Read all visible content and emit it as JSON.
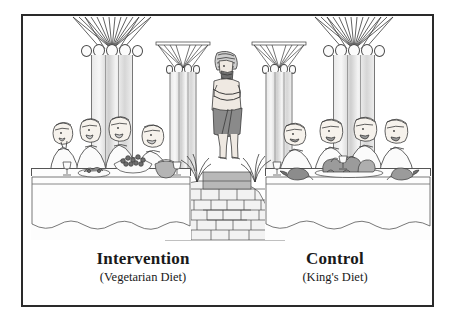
{
  "figure": {
    "frame": {
      "border_color": "#2a2a2a"
    },
    "captions": [
      {
        "title": "Intervention",
        "subtitle": "(Vegetarian Diet)"
      },
      {
        "title": "Control",
        "subtitle": "(King's Diet)"
      }
    ],
    "scene": {
      "center_figure": "standing-king-statue",
      "pedestal": "stone-pedestal",
      "plants": "reed-plants",
      "columns": [
        {
          "name": "papyrus-column-far-left",
          "size": "large"
        },
        {
          "name": "papyrus-column-inner-left",
          "size": "small"
        },
        {
          "name": "papyrus-column-inner-right",
          "size": "small"
        },
        {
          "name": "papyrus-column-far-right",
          "size": "large"
        }
      ],
      "tables": [
        {
          "name": "intervention-table",
          "diners": 4,
          "food": [
            "grape-cluster",
            "vegetable-bowl",
            "fruit-basket",
            "greens",
            "goblet"
          ]
        },
        {
          "name": "control-table",
          "diners": 4,
          "food": [
            "roast-fowl",
            "roast-meat-platter",
            "roast-bird",
            "goblet"
          ]
        }
      ]
    },
    "palette": {
      "ink": "#3a3a3a",
      "skin": "#efe9e2",
      "kilt": "#8a8a8a",
      "stone": "#d9d9d9",
      "meat": "#9b9b9b",
      "veg": "#6e6e6e",
      "paper": "#ffffff"
    }
  }
}
